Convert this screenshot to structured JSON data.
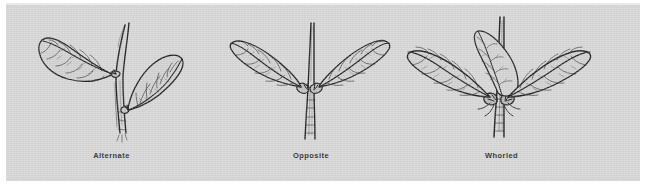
{
  "figure": {
    "kind": "botanical-line-drawing-plate",
    "background_color": "#d6d6d6",
    "page_color": "#ffffff",
    "ink_color": "#1e1e1e"
  },
  "panels": [
    {
      "id": "alternate",
      "caption": "Alternate",
      "leaf_count": 2,
      "description": "Leaves attached singly at staggered nodes along the stem",
      "icon": "leaf-icon"
    },
    {
      "id": "opposite",
      "caption": "Opposite",
      "leaf_count": 2,
      "description": "Two leaves attached directly across from each other at the same node",
      "icon": "leaf-icon"
    },
    {
      "id": "whorled",
      "caption": "Whorled",
      "leaf_count": 3,
      "description": "Three leaves radiating from a single node around the stem",
      "icon": "leaf-icon"
    }
  ]
}
